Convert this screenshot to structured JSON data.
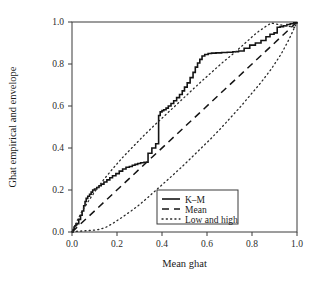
{
  "chart_data": {
    "type": "line",
    "title": "",
    "xlabel": "Mean ghat",
    "ylabel": "Ghat empirical and envelope",
    "xlim": [
      0.0,
      1.0
    ],
    "ylim": [
      0.0,
      1.0
    ],
    "grid": false,
    "legend_position": "lower-right",
    "xticks": [
      "0.0",
      "0.2",
      "0.4",
      "0.6",
      "0.8",
      "1.0"
    ],
    "xtick_values": [
      0.0,
      0.2,
      0.4,
      0.6,
      0.8,
      1.0
    ],
    "yticks": [
      "0.0",
      "0.2",
      "0.4",
      "0.6",
      "0.8",
      "1.0"
    ],
    "ytick_values": [
      0.0,
      0.2,
      0.4,
      0.6,
      0.8,
      1.0
    ],
    "legend": [
      {
        "label": "K–M",
        "style": "solid"
      },
      {
        "label": "Mean",
        "style": "dashed"
      },
      {
        "label": "Low and high",
        "style": "dotted"
      }
    ],
    "series": [
      {
        "name": "K–M",
        "style": "solid",
        "type": "step",
        "x": [
          0.0,
          0.005,
          0.01,
          0.013,
          0.018,
          0.022,
          0.03,
          0.038,
          0.045,
          0.052,
          0.058,
          0.063,
          0.07,
          0.078,
          0.085,
          0.092,
          0.1,
          0.11,
          0.12,
          0.13,
          0.142,
          0.155,
          0.168,
          0.18,
          0.195,
          0.21,
          0.225,
          0.24,
          0.255,
          0.268,
          0.28,
          0.292,
          0.305,
          0.32,
          0.338,
          0.355,
          0.372,
          0.385,
          0.392,
          0.4,
          0.408,
          0.418,
          0.428,
          0.44,
          0.452,
          0.465,
          0.478,
          0.49,
          0.5,
          0.512,
          0.525,
          0.538,
          0.548,
          0.558,
          0.568,
          0.578,
          0.59,
          0.605,
          0.62,
          0.64,
          0.665,
          0.69,
          0.715,
          0.74,
          0.765,
          0.79,
          0.815,
          0.84,
          0.862,
          0.88,
          0.898,
          0.912,
          0.925,
          0.94,
          0.955,
          0.97,
          0.985,
          1.0
        ],
        "y": [
          0.0,
          0.012,
          0.025,
          0.03,
          0.035,
          0.04,
          0.06,
          0.08,
          0.1,
          0.125,
          0.145,
          0.16,
          0.17,
          0.18,
          0.19,
          0.2,
          0.205,
          0.212,
          0.22,
          0.228,
          0.238,
          0.248,
          0.258,
          0.268,
          0.278,
          0.29,
          0.3,
          0.308,
          0.312,
          0.318,
          0.322,
          0.326,
          0.33,
          0.332,
          0.375,
          0.4,
          0.42,
          0.555,
          0.572,
          0.578,
          0.582,
          0.59,
          0.6,
          0.612,
          0.625,
          0.64,
          0.655,
          0.672,
          0.69,
          0.71,
          0.735,
          0.76,
          0.785,
          0.805,
          0.822,
          0.838,
          0.845,
          0.85,
          0.852,
          0.853,
          0.855,
          0.856,
          0.858,
          0.862,
          0.875,
          0.89,
          0.9,
          0.912,
          0.93,
          0.942,
          0.948,
          0.975,
          0.978,
          0.982,
          0.988,
          0.992,
          0.996,
          1.0
        ]
      },
      {
        "name": "Mean",
        "style": "dashed",
        "type": "line",
        "x": [
          0.0,
          1.0
        ],
        "y": [
          0.0,
          1.0
        ]
      },
      {
        "name": "High",
        "style": "dotted",
        "type": "line",
        "x": [
          0.0,
          0.02,
          0.045,
          0.07,
          0.1,
          0.14,
          0.18,
          0.225,
          0.27,
          0.32,
          0.37,
          0.42,
          0.47,
          0.52,
          0.57,
          0.62,
          0.67,
          0.72,
          0.77,
          0.82,
          0.86,
          0.885,
          0.92,
          0.96,
          1.0
        ],
        "y": [
          0.0,
          0.048,
          0.1,
          0.142,
          0.19,
          0.248,
          0.3,
          0.355,
          0.405,
          0.46,
          0.512,
          0.562,
          0.612,
          0.662,
          0.712,
          0.76,
          0.808,
          0.852,
          0.9,
          0.948,
          0.978,
          0.995,
          0.988,
          0.98,
          0.972
        ]
      },
      {
        "name": "Low",
        "style": "dotted",
        "type": "line",
        "x": [
          0.0,
          0.03,
          0.06,
          0.09,
          0.12,
          0.15,
          0.18,
          0.22,
          0.26,
          0.3,
          0.345,
          0.39,
          0.435,
          0.48,
          0.525,
          0.57,
          0.615,
          0.66,
          0.705,
          0.75,
          0.795,
          0.84,
          0.885,
          0.93,
          0.965,
          1.0
        ],
        "y": [
          0.002,
          0.004,
          0.006,
          0.008,
          0.012,
          0.022,
          0.04,
          0.068,
          0.098,
          0.13,
          0.172,
          0.215,
          0.258,
          0.302,
          0.348,
          0.395,
          0.442,
          0.492,
          0.545,
          0.598,
          0.655,
          0.712,
          0.775,
          0.848,
          0.918,
          1.0
        ]
      }
    ]
  }
}
